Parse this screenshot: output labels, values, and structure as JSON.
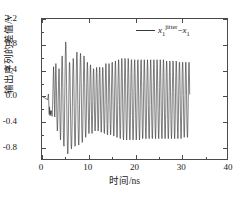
{
  "chart_data": {
    "type": "line",
    "title": "",
    "xlabel": "时间/ns",
    "ylabel": "输出序列的差值/V",
    "xlim": [
      0,
      40
    ],
    "ylim": [
      -1.0,
      1.2
    ],
    "xticks": [
      "0",
      "10",
      "20",
      "30",
      "40"
    ],
    "xtick_values": [
      0,
      10,
      20,
      30,
      40
    ],
    "xminor_values": [
      5,
      15,
      25,
      35
    ],
    "yticks": [
      "1.2",
      "0.8",
      "0.4",
      "0.0",
      "-0.4",
      "-0.8"
    ],
    "ytick_values": [
      1.2,
      0.8,
      0.4,
      0.0,
      -0.4,
      -0.8
    ],
    "grid": false,
    "legend_position": "top-right",
    "line_color": "#2e2e2e",
    "line_width": 0.6,
    "series": [
      {
        "name": "x1_jitter_minus_x1",
        "legend_label": "x₁^jitter − x₁",
        "x_start": 0,
        "x_step": 0.0625,
        "values": [
          -0.02,
          -0.02,
          -0.02,
          -0.02,
          -0.03,
          -0.03,
          -0.03,
          -0.03,
          -0.03,
          -0.04,
          -0.04,
          -0.04,
          -0.05,
          -0.05,
          -0.05,
          -0.06,
          -0.06,
          -0.06,
          -0.06,
          -0.07,
          -0.05,
          -0.02,
          0.02,
          -0.04,
          -0.22,
          -0.3,
          -0.18,
          -0.26,
          -0.32,
          -0.24,
          -0.3,
          -0.27,
          -0.24,
          -0.26,
          -0.3,
          -0.33,
          -0.22,
          -0.12,
          0.09,
          0.3,
          0.45,
          0.33,
          0.1,
          -0.14,
          -0.34,
          -0.2,
          0.1,
          0.38,
          0.5,
          0.36,
          0.1,
          -0.2,
          -0.44,
          -0.56,
          -0.5,
          -0.34,
          -0.1,
          0.14,
          0.34,
          0.42,
          0.26,
          -0.04,
          -0.34,
          -0.58,
          -0.7,
          -0.58,
          -0.3,
          0.06,
          0.38,
          0.58,
          0.62,
          0.46,
          0.12,
          -0.26,
          -0.58,
          -0.76,
          -0.8,
          -0.66,
          -0.34,
          0.06,
          0.44,
          0.7,
          0.84,
          0.78,
          0.52,
          0.14,
          -0.26,
          -0.6,
          -0.82,
          -0.92,
          -0.86,
          -0.66,
          -0.34,
          0.02,
          0.34,
          0.52,
          0.5,
          0.3,
          -0.02,
          -0.36,
          -0.64,
          -0.8,
          -0.84,
          -0.74,
          -0.5,
          -0.18,
          0.18,
          0.46,
          0.58,
          0.52,
          0.28,
          -0.06,
          -0.4,
          -0.66,
          -0.8,
          -0.78,
          -0.58,
          -0.26,
          0.12,
          0.44,
          0.64,
          0.68,
          0.54,
          0.24,
          -0.14,
          -0.48,
          -0.7,
          -0.78,
          -0.7,
          -0.46,
          -0.12,
          0.24,
          0.52,
          0.66,
          0.62,
          0.4,
          0.04,
          -0.32,
          -0.6,
          -0.74,
          -0.72,
          -0.54,
          -0.24,
          0.12,
          0.44,
          0.62,
          0.6,
          0.4,
          0.06,
          -0.28,
          -0.54,
          -0.66,
          -0.62,
          -0.42,
          -0.12,
          0.2,
          0.44,
          0.52,
          0.42,
          0.16,
          -0.18,
          -0.46,
          -0.6,
          -0.58,
          -0.4,
          -0.1,
          0.22,
          0.44,
          0.48,
          0.34,
          0.06,
          -0.26,
          -0.5,
          -0.6,
          -0.52,
          -0.3,
          0.0,
          0.26,
          0.42,
          0.4,
          0.22,
          -0.08,
          -0.36,
          -0.54,
          -0.56,
          -0.42,
          -0.16,
          0.14,
          0.36,
          0.44,
          0.36,
          0.14,
          -0.16,
          -0.42,
          -0.56,
          -0.52,
          -0.32,
          -0.02,
          0.26,
          0.44,
          0.44,
          0.28,
          0.0,
          -0.28,
          -0.5,
          -0.58,
          -0.48,
          -0.24,
          0.06,
          0.32,
          0.44,
          0.4,
          0.2,
          -0.12,
          -0.4,
          -0.58,
          -0.6,
          -0.44,
          -0.16,
          0.16,
          0.4,
          0.5,
          0.42,
          0.18,
          -0.14,
          -0.44,
          -0.62,
          -0.62,
          -0.44,
          -0.14,
          0.18,
          0.42,
          0.5,
          0.4,
          0.14,
          -0.18,
          -0.46,
          -0.62,
          -0.6,
          -0.4,
          -0.08,
          0.24,
          0.46,
          0.52,
          0.4,
          0.12,
          -0.2,
          -0.48,
          -0.64,
          -0.62,
          -0.42,
          -0.1,
          0.22,
          0.46,
          0.54,
          0.44,
          0.16,
          -0.18,
          -0.48,
          -0.66,
          -0.66,
          -0.48,
          -0.16,
          0.18,
          0.44,
          0.56,
          0.48,
          0.22,
          -0.14,
          -0.46,
          -0.66,
          -0.68,
          -0.52,
          -0.2,
          0.16,
          0.44,
          0.58,
          0.52,
          0.26,
          -0.1,
          -0.44,
          -0.66,
          -0.7,
          -0.56,
          -0.24,
          0.12,
          0.42,
          0.58,
          0.54,
          0.3,
          -0.06,
          -0.4,
          -0.64,
          -0.7,
          -0.58,
          -0.28,
          0.08,
          0.4,
          0.58,
          0.56,
          0.34,
          -0.02,
          -0.36,
          -0.62,
          -0.7,
          -0.6,
          -0.32,
          0.04,
          0.36,
          0.56,
          0.56,
          0.36,
          0.02,
          -0.32,
          -0.6,
          -0.7,
          -0.62,
          -0.36,
          0.0,
          0.34,
          0.54,
          0.56,
          0.38,
          0.06,
          -0.28,
          -0.58,
          -0.7,
          -0.64,
          -0.4,
          -0.04,
          0.3,
          0.52,
          0.56,
          0.4,
          0.1,
          -0.26,
          -0.54,
          -0.7,
          -0.66,
          -0.44,
          -0.08,
          0.26,
          0.5,
          0.56,
          0.42,
          0.12,
          -0.22,
          -0.52,
          -0.68,
          -0.66,
          -0.46,
          -0.12,
          0.22,
          0.48,
          0.56,
          0.44,
          0.16,
          -0.2,
          -0.5,
          -0.68,
          -0.68,
          -0.48,
          -0.16,
          0.2,
          0.46,
          0.56,
          0.46,
          0.18,
          -0.16,
          -0.48,
          -0.66,
          -0.68,
          -0.5,
          -0.18,
          0.18,
          0.44,
          0.56,
          0.46,
          0.2,
          -0.14,
          -0.46,
          -0.66,
          -0.68,
          -0.52,
          -0.2,
          0.16,
          0.44,
          0.56,
          0.48,
          0.22,
          -0.12,
          -0.44,
          -0.64,
          -0.68,
          -0.54,
          -0.22,
          0.14,
          0.42,
          0.56,
          0.48,
          0.24,
          -0.1,
          -0.42,
          -0.64,
          -0.68,
          -0.54,
          -0.24,
          0.12,
          0.42,
          0.56,
          0.5,
          0.26,
          -0.08,
          -0.42,
          -0.62,
          -0.68,
          -0.56,
          -0.26,
          0.1,
          0.4,
          0.56,
          0.5,
          0.28,
          -0.06,
          -0.4,
          -0.62,
          -0.68,
          -0.56,
          -0.28,
          0.08,
          0.4,
          0.54,
          0.5,
          0.28,
          -0.04,
          -0.38,
          -0.62,
          -0.68,
          -0.58,
          -0.3,
          0.06,
          0.38,
          0.54,
          0.52,
          0.3,
          -0.04,
          -0.38,
          -0.6,
          -0.68,
          -0.58,
          -0.3,
          0.06,
          0.36,
          0.54,
          0.52,
          0.3,
          -0.02,
          -0.36,
          -0.6,
          -0.68,
          -0.58,
          -0.32,
          0.04,
          0.36,
          0.54,
          0.52,
          0.32,
          -0.02,
          -0.34,
          -0.58,
          -0.68,
          -0.6,
          -0.32,
          0.02,
          0.34,
          0.52,
          0.52,
          0.32,
          0.0,
          -0.34,
          -0.58,
          -0.68,
          -0.6,
          -0.34,
          0.02,
          0.34,
          0.52,
          0.52,
          0.34,
          0.0,
          -0.32,
          -0.58,
          -0.66,
          -0.6,
          -0.34,
          0.0,
          0.32,
          0.52,
          0.52,
          0.34,
          0.02,
          -0.32,
          -0.56,
          -0.66,
          -0.6,
          -0.36,
          -0.02,
          0.32,
          0.5,
          0.52,
          0.34,
          0.02
        ]
      }
    ]
  },
  "legend": {
    "base": "x",
    "base_sub": "1",
    "superscript": "jitter",
    "operator": "−",
    "second": "x",
    "second_sub": "1"
  }
}
